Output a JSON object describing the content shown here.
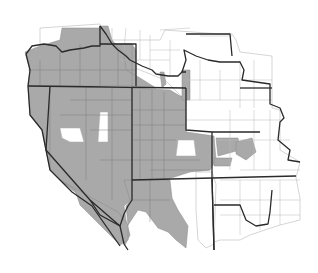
{
  "map": {
    "type": "choropleth-county-map",
    "region": "Western United States",
    "legend": null,
    "colors": {
      "shaded": "#a9a9a9",
      "unshaded": "#ffffff",
      "state_border": "#2a2a2a",
      "county_border": "#7c7c7c"
    },
    "shaded_areas": [
      "Oregon (most counties)",
      "Idaho (west and south)",
      "Nevada",
      "Utah",
      "California (east/southeast portion)",
      "Arizona (west)",
      "Colorado (parts)"
    ],
    "unshaded_areas": [
      "Washington (mostly)",
      "Montana",
      "Wyoming (mostly)",
      "Nebraska",
      "Kansas",
      "New Mexico",
      "eastern Colorado counties"
    ]
  }
}
